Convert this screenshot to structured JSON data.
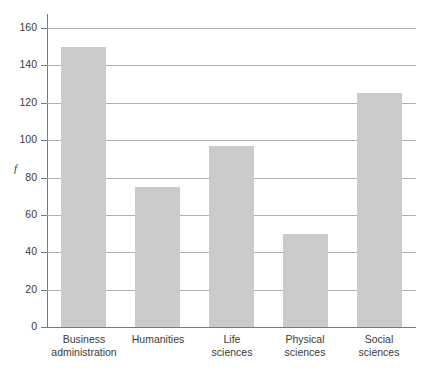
{
  "chart_data": {
    "type": "bar",
    "title": "",
    "subtitle": "",
    "xlabel": "",
    "ylabel": "f",
    "categories": [
      "Business administration",
      "Humanities",
      "Life sciences",
      "Physical sciences",
      "Social sciences"
    ],
    "category_lines": [
      [
        "Business",
        "administration"
      ],
      [
        "Humanities",
        ""
      ],
      [
        "Life",
        "sciences"
      ],
      [
        "Physical",
        "sciences"
      ],
      [
        "Social",
        "sciences"
      ]
    ],
    "values": [
      150,
      75,
      97,
      50,
      125
    ],
    "ylim": [
      0,
      160
    ],
    "ytick_step": 20,
    "yticks": [
      0,
      20,
      40,
      60,
      80,
      100,
      120,
      140,
      160
    ],
    "ytick_labels": [
      "0",
      "20",
      "40",
      "60",
      "80",
      "100",
      "120",
      "140",
      "160"
    ],
    "grid": true,
    "grid_axis": "y",
    "legend": false,
    "legend_position": "none",
    "bar_color": "#cbcbcb",
    "grid_color": "#aeb0b3",
    "axis_color": "#77797c",
    "text_color": "#3a3a3a",
    "background": "#ffffff"
  }
}
